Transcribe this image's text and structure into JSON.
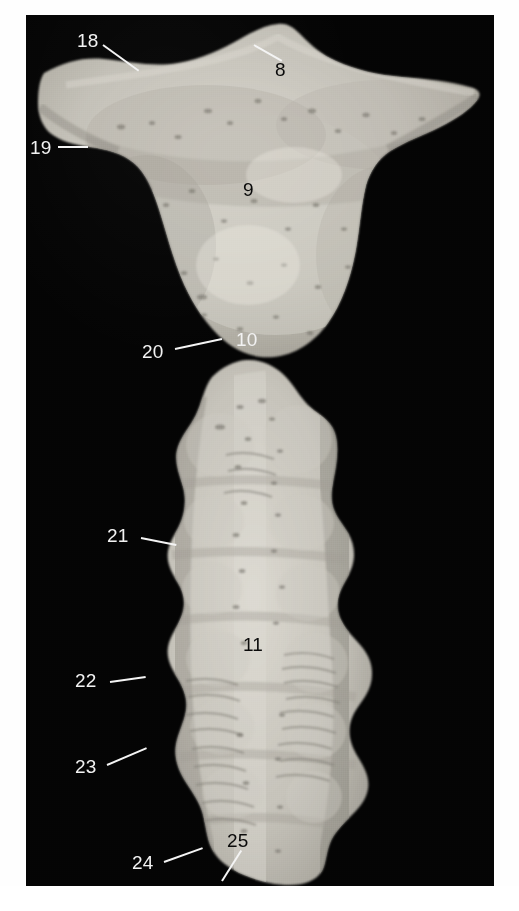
{
  "figure": {
    "kind": "photographic-plate",
    "plate_background_color": "#050505",
    "page_background_color": "#ffffff",
    "bone_color": "#bfbcb4",
    "label_light_color": "#f2f2f2",
    "label_dark_color": "#0a0a0a"
  },
  "specimens": [
    {
      "name": "upper-specimen",
      "region_label": "9"
    },
    {
      "name": "lower-specimen",
      "region_label": "11"
    }
  ],
  "labels": [
    {
      "id": "label-18",
      "text": "18",
      "tone": "light",
      "x": 77,
      "y": 31
    },
    {
      "id": "label-8",
      "text": "8",
      "tone": "dark",
      "x": 275,
      "y": 60
    },
    {
      "id": "label-19",
      "text": "19",
      "tone": "light",
      "x": 30,
      "y": 138
    },
    {
      "id": "label-9",
      "text": "9",
      "tone": "dark",
      "x": 243,
      "y": 180
    },
    {
      "id": "label-10",
      "text": "10",
      "tone": "light",
      "x": 236,
      "y": 330
    },
    {
      "id": "label-20",
      "text": "20",
      "tone": "light",
      "x": 142,
      "y": 342
    },
    {
      "id": "label-21",
      "text": "21",
      "tone": "light",
      "x": 107,
      "y": 526
    },
    {
      "id": "label-11",
      "text": "11",
      "tone": "dark",
      "x": 243,
      "y": 635
    },
    {
      "id": "label-22",
      "text": "22",
      "tone": "light",
      "x": 75,
      "y": 671
    },
    {
      "id": "label-23",
      "text": "23",
      "tone": "light",
      "x": 75,
      "y": 757
    },
    {
      "id": "label-25",
      "text": "25",
      "tone": "dark",
      "x": 227,
      "y": 831
    },
    {
      "id": "label-24",
      "text": "24",
      "tone": "light",
      "x": 132,
      "y": 853
    }
  ],
  "leaders": [
    {
      "id": "leader-18",
      "x1": 103,
      "y1": 44,
      "x2": 139,
      "y2": 70
    },
    {
      "id": "leader-8",
      "x1": 254,
      "y1": 44,
      "x2": 282,
      "y2": 60
    },
    {
      "id": "leader-19",
      "x1": 58,
      "y1": 146,
      "x2": 88,
      "y2": 146
    },
    {
      "id": "leader-20",
      "x1": 175,
      "y1": 348,
      "x2": 222,
      "y2": 338
    },
    {
      "id": "leader-21",
      "x1": 141,
      "y1": 537,
      "x2": 176,
      "y2": 544
    },
    {
      "id": "leader-22",
      "x1": 110,
      "y1": 681,
      "x2": 146,
      "y2": 676
    },
    {
      "id": "leader-23",
      "x1": 107,
      "y1": 764,
      "x2": 147,
      "y2": 747
    },
    {
      "id": "leader-24",
      "x1": 164,
      "y1": 861,
      "x2": 203,
      "y2": 847
    },
    {
      "id": "leader-25",
      "x1": 222,
      "y1": 880,
      "x2": 241,
      "y2": 850
    }
  ]
}
